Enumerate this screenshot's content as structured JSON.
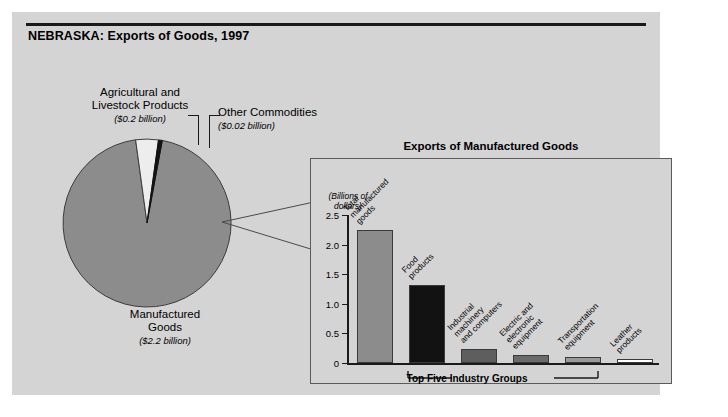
{
  "figure": {
    "title": "NEBRASKA: Exports of Goods, 1997"
  },
  "pie": {
    "labels": {
      "agricultural": "Agricultural and\nLivestock Products",
      "agricultural_line1": "Agricultural and",
      "agricultural_line2": "Livestock Products",
      "agricultural_amount": "($0.2 billion)",
      "other": "Other Commodities",
      "other_amount": "($0.02 billion)",
      "manufactured_line1": "Manufactured",
      "manufactured_line2": "Goods",
      "manufactured_amount": "($2.2 billion)"
    }
  },
  "inset": {
    "title": "Exports of Manufactured Goods",
    "axis_unit_line1": "(Billions of",
    "axis_unit_line2": "dollars)",
    "bracket_label": "Top Five Industry Groups"
  },
  "chart_data": [
    {
      "type": "pie",
      "title": "NEBRASKA: Exports of Goods, 1997",
      "unit": "billions of dollars",
      "labels": [
        "Manufactured Goods",
        "Agricultural and Livestock Products",
        "Other Commodities"
      ],
      "values": [
        2.2,
        0.2,
        0.02
      ],
      "value_labels": [
        "($2.2 billion)",
        "($0.2 billion)",
        "($0.02 billion)"
      ],
      "colors": [
        "#8c8c8c",
        "#eeeeee",
        "#111111"
      ],
      "legend": "none",
      "annotations": [
        "Inset bar chart expands the Manufactured Goods slice"
      ]
    },
    {
      "type": "bar",
      "title": "Exports of Manufactured Goods",
      "xlabel": "",
      "ylabel": "(Billions of dollars)",
      "ylim": [
        0,
        2.5
      ],
      "ytick_labels": [
        "0",
        "0.5",
        "1.0",
        "1.5",
        "2.0",
        "2.5"
      ],
      "ytick_values": [
        0,
        0.5,
        1.0,
        1.5,
        2.0,
        2.5
      ],
      "grid": false,
      "legend": "none",
      "categories": [
        "Total manufactured goods",
        "Food products",
        "Industrial machinery and computers",
        "Electric and electronic equipment",
        "Transportation equipment",
        "Leather products"
      ],
      "category_lines": [
        [
          "Total",
          "manufactured",
          "goods"
        ],
        [
          "Food",
          "products"
        ],
        [
          "Industrial",
          "machinery",
          "and computers"
        ],
        [
          "Electric and",
          "electronic",
          "equipment"
        ],
        [
          "Transportation",
          "equipment"
        ],
        [
          "Leather",
          "products"
        ]
      ],
      "values": [
        2.25,
        1.32,
        0.23,
        0.13,
        0.11,
        0.07
      ],
      "colors": [
        "#8c8c8c",
        "#121212",
        "#5e5e5e",
        "#6b6b6b",
        "#9a9a9a",
        "#ffffff"
      ],
      "annotations": [
        "Top Five Industry Groups spans the last five bars"
      ]
    }
  ]
}
